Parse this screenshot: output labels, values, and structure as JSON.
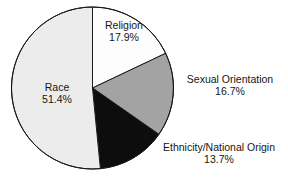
{
  "chart_data": {
    "type": "pie",
    "title": "",
    "subtitle": "",
    "xlabel": "",
    "ylabel": "",
    "legend_position": "none",
    "grid": false,
    "start_angle_deg": 0,
    "direction": "clockwise",
    "units": "percent",
    "categories": [
      "Religion",
      "Sexual Orientation",
      "Ethnicity/National Origin",
      "Race"
    ],
    "values": [
      17.9,
      16.7,
      13.7,
      51.4
    ],
    "value_labels": [
      "17.9%",
      "16.7%",
      "13.7%",
      "51.4%"
    ],
    "colors": [
      "#fdfdfd",
      "#a3a3a3",
      "#0d0d0d",
      "#ececec"
    ],
    "slices": [
      {
        "name": "Religion",
        "value": 17.9,
        "value_label": "17.9%",
        "color": "#fdfdfd",
        "label_position": "inside"
      },
      {
        "name": "Sexual Orientation",
        "value": 16.7,
        "value_label": "16.7%",
        "color": "#a3a3a3",
        "label_position": "outside-right"
      },
      {
        "name": "Ethnicity/National Origin",
        "value": 13.7,
        "value_label": "13.7%",
        "color": "#0d0d0d",
        "label_position": "outside-bottom-right"
      },
      {
        "name": "Race",
        "value": 51.4,
        "value_label": "51.4%",
        "color": "#ececec",
        "label_position": "inside"
      }
    ]
  },
  "style": {
    "background": "#ffffff",
    "outline_color": "#1a1a1a",
    "text_color": "#161616"
  }
}
